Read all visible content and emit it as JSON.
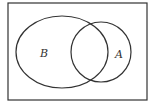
{
  "diagram": {
    "type": "venn",
    "universe": {
      "x": 8,
      "y": 3,
      "width": 139,
      "height": 97
    },
    "sets": [
      {
        "label": "B",
        "cx": 62,
        "cy": 52,
        "rx": 46,
        "ry": 36,
        "label_x": 43,
        "label_y": 57
      },
      {
        "label": "A",
        "cx": 101,
        "cy": 52,
        "rx": 30,
        "ry": 30,
        "label_x": 117,
        "label_y": 58
      }
    ],
    "stroke_color": "#333333"
  }
}
